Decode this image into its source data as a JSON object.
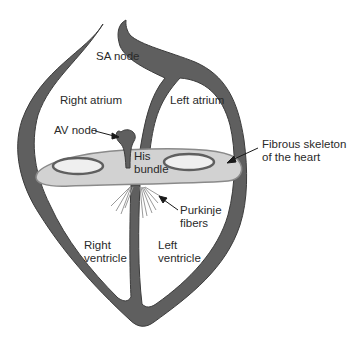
{
  "diagram": {
    "colors": {
      "wall": "#5f5f5f",
      "wall_edge": "#3c3c3c",
      "fibrous_skeleton": "#d2d2d2",
      "fibrous_edge": "#8a8a8a",
      "valve_opening": "#efefef",
      "fibers": "#9a9a9a",
      "text": "#2a2a2a",
      "background": "#ffffff"
    },
    "labels": {
      "sa_node": "SA node",
      "right_atrium": "Right atrium",
      "left_atrium": "Left atrium",
      "av_node": "AV node",
      "his_bundle_line1": "His",
      "his_bundle_line2": "bundle",
      "fibrous_line1": "Fibrous skeleton",
      "fibrous_line2": "of the heart",
      "purkinje_line1": "Purkinje",
      "purkinje_line2": "fibers",
      "right_ventricle_line1": "Right",
      "right_ventricle_line2": "ventricle",
      "left_ventricle_line1": "Left",
      "left_ventricle_line2": "ventricle"
    }
  }
}
